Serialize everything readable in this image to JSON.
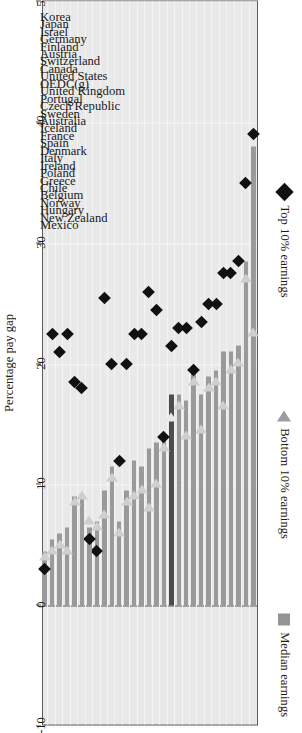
{
  "chart_data": {
    "type": "bar",
    "title": "",
    "xlabel": "Percentage pay gap between men and women",
    "ylabel": "",
    "axis_title_line1": "Percentage pay gap",
    "axis_title_line2": "between men and women",
    "xlim": [
      50,
      -10
    ],
    "ticks": [
      50,
      40,
      30,
      20,
      10,
      0,
      -10
    ],
    "tick_labels": [
      "50",
      "40",
      "30",
      "20",
      "10",
      "0",
      "-10"
    ],
    "grid": true,
    "legend_position": "left",
    "orientation": "horizontal-bars-rotated",
    "highlight_category": "Portugal",
    "legend": [
      {
        "label": "Top 10% earnings",
        "marker": "diamond",
        "color": "#111111"
      },
      {
        "label": "Bottom 10% earnings",
        "marker": "triangle-left",
        "color": "#9d9d9d"
      },
      {
        "label": "Median earnings",
        "marker": "square",
        "color": "#949494"
      }
    ],
    "categories": [
      "Korea",
      "Japan",
      "Israel",
      "Germany",
      "Finland",
      "Austria",
      "Switzerland",
      "Canada",
      "United States",
      "OEDC(g)",
      "United Kingdom",
      "Portugal",
      "Czech Republic",
      "Sweden",
      "Australia",
      "Iceland",
      "France",
      "Spain",
      "Denmark",
      "Italy",
      "Ireland",
      "Poland",
      "Greece",
      "Chile",
      "Belgium",
      "Norway",
      "Hungary",
      "New Zealand",
      "Mexico"
    ],
    "series": [
      {
        "name": "Median earnings",
        "marker": "square",
        "color": "#9a9a9a",
        "values": [
          38.0,
          28.5,
          21.5,
          21.0,
          21.0,
          19.5,
          19.0,
          17.5,
          19.5,
          17.0,
          17.5,
          17.5,
          14.0,
          13.5,
          13.0,
          11.5,
          12.0,
          9.5,
          7.0,
          11.5,
          9.5,
          7.0,
          6.5,
          9.0,
          9.0,
          6.5,
          6.0,
          5.5,
          4.5
        ]
      },
      {
        "name": "Top 10% earnings",
        "marker": "diamond",
        "color": "#111111",
        "values": [
          39.0,
          35.0,
          28.5,
          27.5,
          27.5,
          25.0,
          25.0,
          23.5,
          19.5,
          23.0,
          23.0,
          21.5,
          14.0,
          24.5,
          26.0,
          22.5,
          22.5,
          20.0,
          12.0,
          20.0,
          25.5,
          4.5,
          5.5,
          18.0,
          18.5,
          22.5,
          21.0,
          22.5,
          3.0
        ]
      },
      {
        "name": "Bottom 10% earnings",
        "marker": "triangle-left",
        "color": "#cfcfcf",
        "values": [
          23.0,
          27.5,
          20.5,
          20.0,
          17.0,
          19.0,
          18.5,
          15.0,
          19.0,
          14.5,
          17.0,
          16.0,
          13.5,
          10.5,
          8.5,
          10.0,
          9.5,
          9.0,
          6.5,
          11.0,
          8.0,
          7.0,
          7.5,
          9.5,
          9.0,
          5.0,
          5.5,
          5.0,
          4.5
        ]
      }
    ]
  }
}
